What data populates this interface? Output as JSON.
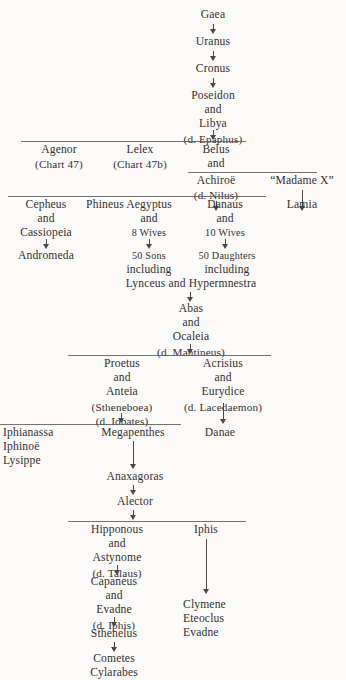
{
  "document": {
    "kind": "genealogical-chart",
    "background_color": "#fcfbfa",
    "ink_color": "#32302e"
  },
  "nodes": {
    "gaea": "Gaea",
    "uranus": "Uranus",
    "cronus": "Cronus",
    "poseidon": "Poseidon",
    "and_1": "and",
    "libya": "Libya",
    "libya_desc": "(d. Epaphus)",
    "agenor": "Agenor",
    "agenor_ref": "(Chart 47)",
    "lelex": "Lelex",
    "lelex_ref": "(Chart 47b)",
    "belus": "Belus",
    "and_2": "and",
    "achiroe": "Achiroë",
    "achiroe_desc": "(d. Nilus)",
    "madame_x": "“Madame X”",
    "cepheus": "Cepheus",
    "and_3": "and",
    "cassiopeia": "Cassiopeia",
    "andromeda": "Andromeda",
    "phineus": "Phineus",
    "aegyptus": "Aegyptus",
    "and_4": "and",
    "eight_wives": "8 Wives",
    "fifty_sons": "50 Sons",
    "including_1": "including",
    "danaus": "Danaus",
    "and_5": "and",
    "ten_wives": "10 Wives",
    "fifty_daughters": "50 Daughters",
    "including_2": "including",
    "lamia": "Lamia",
    "lynceus_hypermnestra": "Lynceus and Hypermnestra",
    "abas": "Abas",
    "and_6": "and",
    "ocaleia": "Ocaleia",
    "ocaleia_desc": "(d. Mantineus)",
    "proetus": "Proetus",
    "and_7": "and",
    "anteia": "Anteia",
    "anteia_alt": "(Stheneboea)",
    "anteia_desc": "(d. Iobates)",
    "acrisius": "Acrisius",
    "and_8": "and",
    "eurydice": "Eurydice",
    "eurydice_desc": "(d. Lacedaemon)",
    "iphianassa": "Iphianassa",
    "iphinoe": "Iphinoë",
    "lysippe": "Lysippe",
    "megapenthes": "Megapenthes",
    "danae": "Danae",
    "anaxagoras": "Anaxagoras",
    "alector": "Alector",
    "hipponous": "Hipponous",
    "and_9": "and",
    "astynome": "Astynome",
    "astynome_desc": "(d. Talaus)",
    "iphis": "Iphis",
    "capaneus": "Capaneus",
    "and_10": "and",
    "evadne": "Evadne",
    "evadne_desc": "(d. Iphis)",
    "clymene": "Clymene",
    "eteoclus": "Eteoclus",
    "evadne_2": "Evadne",
    "sthenelus": "Sthenelus",
    "cometes": "Cometes",
    "cylarabes": "Cylarabes"
  },
  "numerals": {
    "fifty": "50",
    "ten": "10",
    "forty_seven": "47",
    "forty_seven_b": "47b",
    "eight": "8"
  }
}
